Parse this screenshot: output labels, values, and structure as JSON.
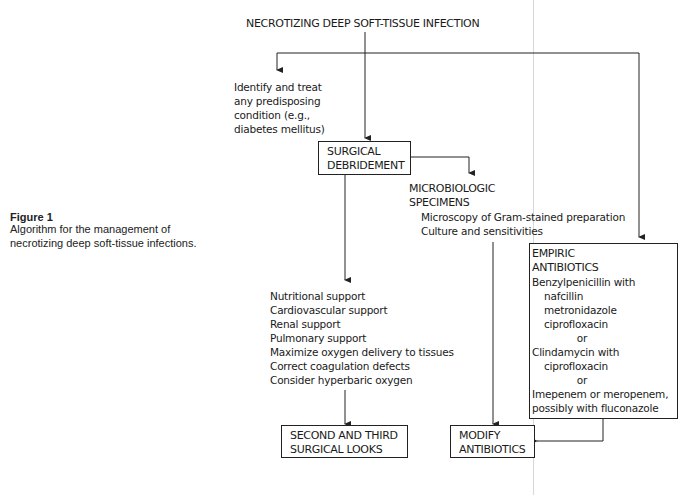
{
  "caption": {
    "title": "Figure 1",
    "lines": [
      "Algorithm for the management of",
      "necrotizing deep soft-tissue infections."
    ]
  },
  "nodes": {
    "root": "NECROTIZING DEEP SOFT-TISSUE INFECTION",
    "identify": [
      "Identify and treat",
      "any predisposing",
      "condition (e.g.,",
      "diabetes mellitus)"
    ],
    "debridement": [
      "SURGICAL",
      "DEBRIDEMENT"
    ],
    "microbiologic": {
      "heading": [
        "MICROBIOLOGIC",
        "SPECIMENS"
      ],
      "items": [
        "Microscopy of Gram-stained preparation",
        "Culture and sensitivities"
      ]
    },
    "support": [
      "Nutritional support",
      "Cardiovascular support",
      "Renal support",
      "Pulmonary support",
      "Maximize oxygen delivery to tissues",
      "Correct coagulation defects",
      "Consider hyperbaric oxygen"
    ],
    "empiric": {
      "heading": [
        "EMPIRIC",
        "ANTIBIOTICS"
      ],
      "option1": "Benzylpenicillin with",
      "option1_items": [
        "nafcillin",
        "metronidazole",
        "ciprofloxacin"
      ],
      "or1": "or",
      "option2": "Clindamycin with",
      "option2_items": [
        "ciprofloxacin"
      ],
      "or2": "or",
      "option3": [
        "Imepenem or meropenem,",
        "possibly with fluconazole"
      ]
    },
    "second_looks": [
      "SECOND AND THIRD",
      "SURGICAL LOOKS"
    ],
    "modify": [
      "MODIFY",
      "ANTIBIOTICS"
    ]
  }
}
